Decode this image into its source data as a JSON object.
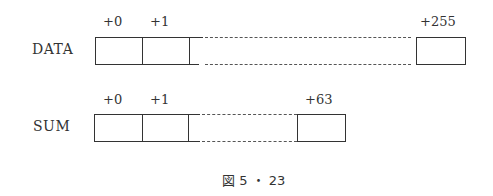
{
  "diagram": {
    "caption": "図 5 ・ 23",
    "arrays": [
      {
        "name": "DATA",
        "offsets": [
          "+0",
          "+1",
          "+255"
        ],
        "cell_count": 256
      },
      {
        "name": "SUM",
        "offsets": [
          "+0",
          "+1",
          "+63"
        ],
        "cell_count": 64
      }
    ]
  }
}
